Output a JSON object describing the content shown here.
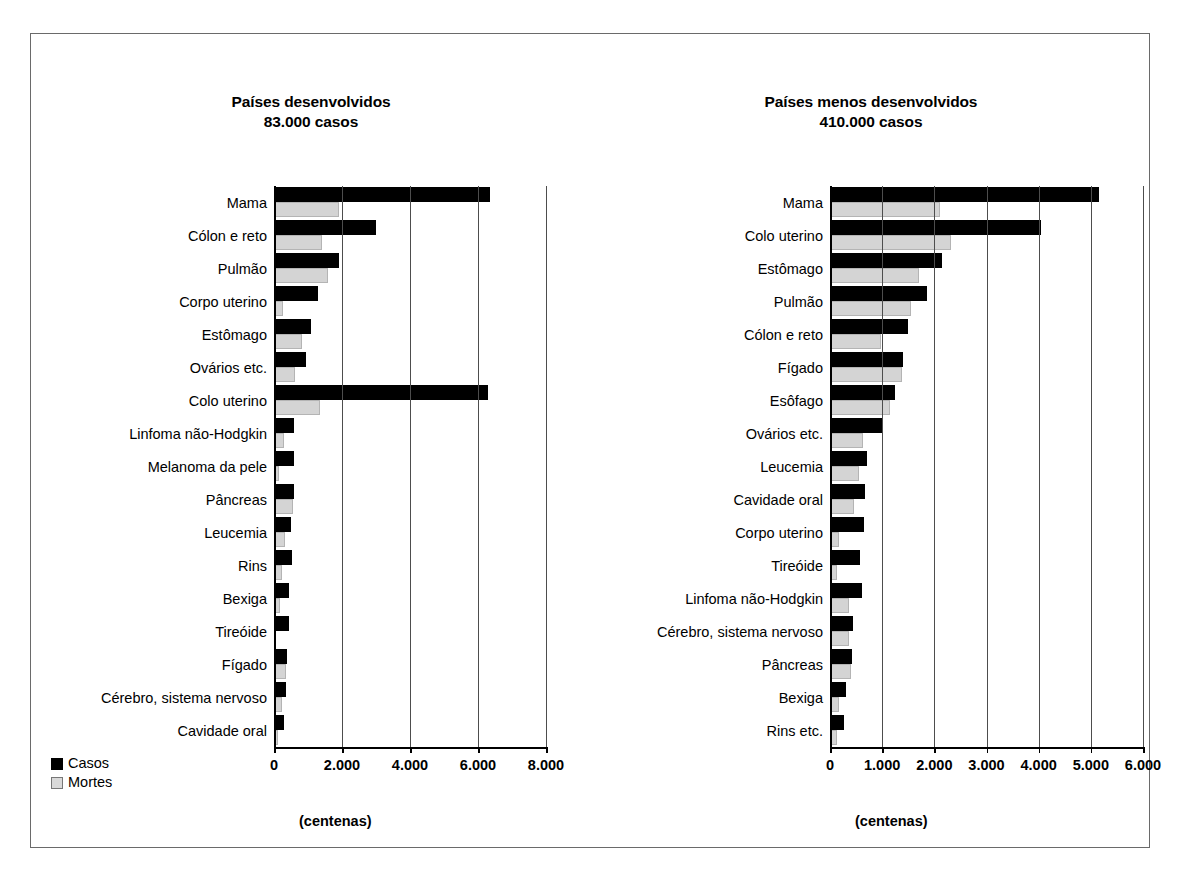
{
  "figure": {
    "legend": {
      "cases_label": "Casos",
      "deaths_label": "Mortes",
      "cases_color": "#000000",
      "deaths_color": "#d4d4d4"
    },
    "units_label": "(centenas)"
  },
  "chart_data": [
    {
      "type": "bar",
      "orientation": "horizontal",
      "title": "Países desenvolvidos",
      "subtitle": "83.000 casos",
      "xlabel": "(centenas)",
      "ylabel": "",
      "xlim": [
        0,
        8000
      ],
      "xticks": [
        0,
        2000,
        4000,
        6000,
        8000
      ],
      "xtick_labels": [
        "0",
        "2.000",
        "4.000",
        "6.000",
        "8.000"
      ],
      "grid": true,
      "legend_position": "bottom-left",
      "categories": [
        "Mama",
        "Cólon e reto",
        "Pulmão",
        "Corpo uterino",
        "Estômago",
        "Ovários etc.",
        "Colo uterino",
        "Linfoma não-Hodgkin",
        "Melanoma da pele",
        "Pâncreas",
        "Leucemia",
        "Rins",
        "Bexiga",
        "Tireóide",
        "Fígado",
        "Cérebro, sistema nervoso",
        "Cavidade oral"
      ],
      "series": [
        {
          "name": "Casos",
          "color": "#000000",
          "values": [
            6350,
            3000,
            1900,
            1300,
            1100,
            950,
            6300,
            600,
            600,
            580,
            500,
            520,
            450,
            450,
            370,
            340,
            280
          ]
        },
        {
          "name": "Mortes",
          "color": "#d4d4d4",
          "values": [
            1900,
            1400,
            1600,
            260,
            830,
            620,
            1350,
            280,
            150,
            560,
            330,
            230,
            170,
            60,
            350,
            230,
            120
          ]
        }
      ]
    },
    {
      "type": "bar",
      "orientation": "horizontal",
      "title": "Países menos desenvolvidos",
      "subtitle": "410.000 casos",
      "xlabel": "(centenas)",
      "ylabel": "",
      "xlim": [
        0,
        6000
      ],
      "xticks": [
        0,
        1000,
        2000,
        3000,
        4000,
        5000,
        6000
      ],
      "xtick_labels": [
        "0",
        "1.000",
        "2.000",
        "3.000",
        "4.000",
        "5.000",
        "6.000"
      ],
      "grid": true,
      "legend_position": "shared",
      "categories": [
        "Mama",
        "Colo uterino",
        "Estômago",
        "Pulmão",
        "Cólon e reto",
        "Fígado",
        "Esôfago",
        "Ovários etc.",
        "Leucemia",
        "Cavidade oral",
        "Corpo uterino",
        "Tireóide",
        "Linfoma não-Hodgkin",
        "Cérebro, sistema nervoso",
        "Pâncreas",
        "Bexiga",
        "Rins etc."
      ],
      "series": [
        {
          "name": "Casos",
          "color": "#000000",
          "values": [
            5150,
            4050,
            2150,
            1850,
            1500,
            1400,
            1250,
            1020,
            700,
            680,
            650,
            570,
            620,
            450,
            430,
            310,
            270
          ]
        },
        {
          "name": "Mortes",
          "color": "#d4d4d4",
          "values": [
            2100,
            2320,
            1700,
            1560,
            980,
            1380,
            1150,
            640,
            560,
            460,
            180,
            130,
            360,
            360,
            410,
            180,
            140
          ]
        }
      ]
    }
  ]
}
